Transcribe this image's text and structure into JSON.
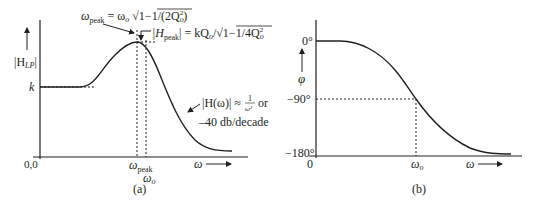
{
  "figure": {
    "colors": {
      "ink": "#231f20",
      "background": "#ffffff"
    },
    "panel_a": {
      "caption": "(a)",
      "y_label": "|H",
      "y_label_sub": "LP",
      "y_label_close": "|",
      "k_label": "k",
      "origin_label": "0,0",
      "x_label": "ω",
      "x_tick_peak": "ω",
      "x_tick_peak_sub": "peak",
      "x_tick_o": "ω",
      "x_tick_o_sub": "o",
      "annotation_wpeak": {
        "lhs": "ω",
        "lhs_sub": "peak",
        "rhs": "= ω",
        "rhs_sub": "o",
        "sqrt_body": "1−1/(2Q",
        "sqrt_sub": "o",
        "sqrt_sup": "2",
        "sqrt_close": ")"
      },
      "annotation_hpeak": {
        "lhs": "|H",
        "lhs_sub": "peak",
        "lhs_close": "| = kQ",
        "q_sub": "o",
        "slash": "/",
        "sqrt_body": "1−1/4Q",
        "sqrt_sub": "o",
        "sqrt_sup": "2"
      },
      "annotation_rolloff": {
        "line1_lhs": "|H(ω)| ≈",
        "frac_num": "1",
        "frac_den": "ω²",
        "line1_tail": "or",
        "line2": "–40 db/decade"
      }
    },
    "panel_b": {
      "caption": "(b)",
      "y_label": "φ",
      "tick_0": "0°",
      "tick_m90": "−90°",
      "tick_m180": "−180°",
      "origin_label": "0",
      "x_tick_o": "ω",
      "x_tick_o_sub": "o",
      "x_label": "ω"
    }
  }
}
